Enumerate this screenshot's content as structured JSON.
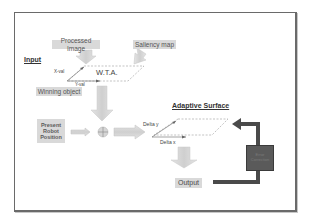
{
  "diagram": {
    "sections": {
      "input_heading": "Input",
      "adaptive_heading": "Adaptive Surface"
    },
    "nodes": {
      "processed_image": "Processed Image",
      "saliency_map": "Saliency map",
      "wta": "W.T.A.",
      "x_val": "X-val",
      "y_val": "Y-val",
      "winning_object": "Winning object",
      "present_robot_position": "Present Robot Position",
      "summing_junction": "⊕",
      "delta_y": "Delta y",
      "delta_x": "Delta x",
      "output": "Output",
      "feedback_block": "Error Correction"
    },
    "edges": [
      {
        "from": "processed_image",
        "to": "wta"
      },
      {
        "from": "saliency_map",
        "to": "wta"
      },
      {
        "from": "wta",
        "to": "summing_junction"
      },
      {
        "from": "present_robot_position",
        "to": "summing_junction"
      },
      {
        "from": "summing_junction",
        "to": "adaptive_surface"
      },
      {
        "from": "adaptive_surface",
        "to": "output"
      },
      {
        "from": "output",
        "to": "feedback_block"
      },
      {
        "from": "feedback_block",
        "to": "adaptive_surface"
      }
    ],
    "colors": {
      "frame": "#6a6a6a",
      "label_box": "#d9d9d9",
      "arrow_fill": "#d0d0d0",
      "feedback": "#4a4a4a"
    }
  }
}
